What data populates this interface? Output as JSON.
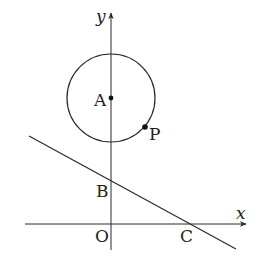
{
  "diagram": {
    "type": "coordinate-geometry",
    "axes": {
      "x_label": "x",
      "y_label": "y",
      "origin_label": "O"
    },
    "circle": {
      "center_label": "A",
      "point_on_circle_label": "P"
    },
    "line": {
      "y_intercept_label": "B",
      "x_intercept_label": "C"
    },
    "colors": {
      "stroke": "#2a2a2a",
      "background": "#ffffff"
    }
  }
}
